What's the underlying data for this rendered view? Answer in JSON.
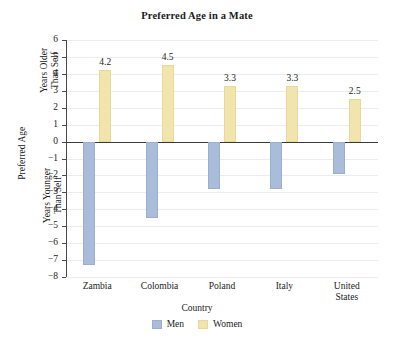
{
  "chart_data": {
    "type": "bar",
    "title": "Preferred Age in a Mate",
    "xlabel": "Country",
    "ylabel": "Preferred Age",
    "ylabel_upper": "Years Older Than Self",
    "ylabel_lower": "Years Younger Than Self",
    "categories": [
      "Zambia",
      "Colombia",
      "Poland",
      "Italy",
      "United States"
    ],
    "series": [
      {
        "name": "Men",
        "color": "#a9bcd9",
        "values": [
          -7.3,
          -4.5,
          -2.8,
          -2.8,
          -1.9
        ]
      },
      {
        "name": "Women",
        "color": "#f2e4ad",
        "values": [
          4.2,
          4.5,
          3.3,
          3.3,
          2.5
        ]
      }
    ],
    "value_labels": [
      "4.2",
      "4.5",
      "3.3",
      "3.3",
      "2.5"
    ],
    "ylim": [
      -8,
      6
    ],
    "yticks": [
      "6",
      "5",
      "4",
      "3",
      "2",
      "1",
      "0",
      "-1",
      "-2",
      "-3",
      "-4",
      "-5",
      "-6",
      "-7",
      "-8"
    ],
    "grid": true,
    "legend_position": "bottom"
  },
  "legend": {
    "men": "Men",
    "women": "Women"
  },
  "categories_display": [
    {
      "line1": "Zambia",
      "line2": ""
    },
    {
      "line1": "Colombia",
      "line2": ""
    },
    {
      "line1": "Poland",
      "line2": ""
    },
    {
      "line1": "Italy",
      "line2": ""
    },
    {
      "line1": "United",
      "line2": "States"
    }
  ]
}
